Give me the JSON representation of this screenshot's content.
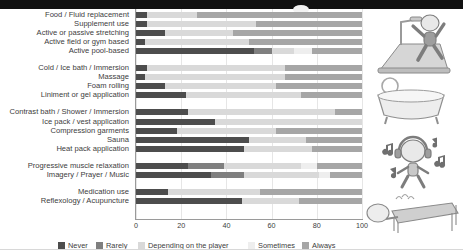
{
  "chart_data": {
    "type": "bar",
    "orientation": "horizontal",
    "stacked": true,
    "normalized_percent": true,
    "title": "",
    "xlabel": "",
    "ylabel": "",
    "xlim": [
      0,
      100
    ],
    "xticks": [
      "0",
      "20",
      "40",
      "60",
      "80",
      "100"
    ],
    "grid": true,
    "legend_position": "bottom",
    "legend": [
      "Never",
      "Rarely",
      "Depending on the player",
      "Sometimes",
      "Always"
    ],
    "colors": {
      "Never": "#4d4d4d",
      "Rarely": "#7f7f7f",
      "Depending on the player": "#d9d9d9",
      "Sometimes": "#eeeeee",
      "Always": "#a6a6a6"
    },
    "categories": [
      "Food / Fluid replacement",
      "Supplement use",
      "Active or passive stretching",
      "Active field or gym based",
      "Active pool-based",
      "Cold / Ice bath / Immersion",
      "Massage",
      "Foam rolling",
      "Liniment or gel application",
      "Contrast bath / Shower / Immersion",
      "Ice pack / vest application",
      "Compression garments",
      "Sauna",
      "Heat pack application",
      "Progressive muscle relaxation",
      "Imagery / Prayer / Music",
      "Medication use",
      "Reflexology / Acupuncture"
    ],
    "series": [
      {
        "name": "Never",
        "values": [
          5,
          5,
          13,
          4,
          52,
          5,
          4,
          13,
          22,
          23,
          35,
          18,
          50,
          48,
          23,
          33,
          14,
          47
        ]
      },
      {
        "name": "Rarely",
        "values": [
          0,
          0,
          0,
          0,
          8,
          0,
          0,
          0,
          0,
          0,
          0,
          0,
          0,
          0,
          16,
          15,
          0,
          0
        ]
      },
      {
        "name": "Depending on the player",
        "values": [
          22,
          48,
          30,
          46,
          10,
          61,
          62,
          49,
          51,
          65,
          65,
          44,
          25,
          30,
          34,
          33,
          41,
          25
        ]
      },
      {
        "name": "Sometimes",
        "values": [
          0,
          0,
          0,
          0,
          8,
          0,
          0,
          0,
          0,
          0,
          0,
          0,
          0,
          0,
          7,
          5,
          0,
          0
        ]
      },
      {
        "name": "Always",
        "values": [
          73,
          47,
          57,
          50,
          22,
          34,
          34,
          38,
          27,
          12,
          0,
          38,
          25,
          22,
          20,
          14,
          45,
          28
        ]
      }
    ],
    "group_gaps_after_rows": [
      5,
      9,
      14,
      16
    ]
  },
  "illustrations": [
    {
      "name": "treadmill-runner-illustration"
    },
    {
      "name": "bathtub-illustration"
    },
    {
      "name": "music-headphones-illustration"
    },
    {
      "name": "massage-table-illustration"
    }
  ]
}
